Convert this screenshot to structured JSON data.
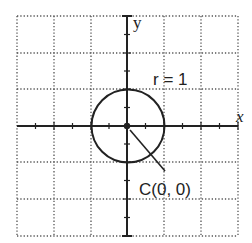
{
  "diagram": {
    "type": "circle-on-coordinate-grid",
    "axes": {
      "x_label": "x",
      "y_label": "y"
    },
    "grid": {
      "columns": 6,
      "rows": 6
    },
    "circle": {
      "center_label": "C(0, 0)",
      "radius_label": "r = 1",
      "center": [
        0,
        0
      ],
      "radius": 1
    },
    "colors": {
      "ink": "#222222",
      "grid": "#555555",
      "background": "#ffffff"
    }
  }
}
